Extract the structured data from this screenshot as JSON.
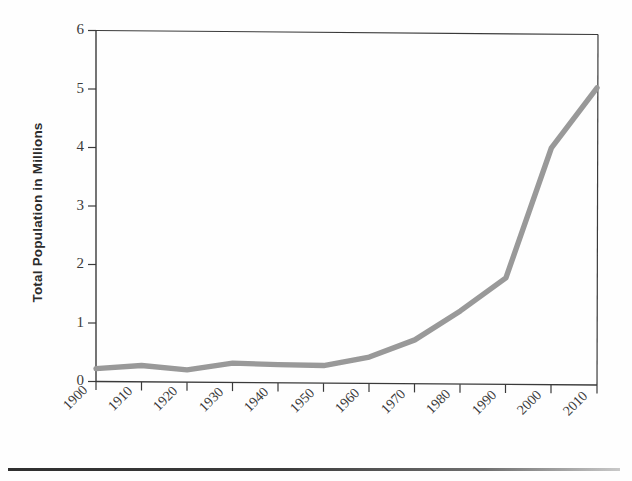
{
  "chart_data": {
    "type": "line",
    "title": "",
    "xlabel": "",
    "ylabel": "Total Population in Millions",
    "x": [
      1900,
      1910,
      1920,
      1930,
      1940,
      1950,
      1960,
      1970,
      1980,
      1990,
      2000,
      2010
    ],
    "categories": [
      "1900",
      "1910",
      "1920",
      "1930",
      "1940",
      "1950",
      "1960",
      "1970",
      "1980",
      "1990",
      "2000",
      "2010"
    ],
    "values": [
      0.22,
      0.28,
      0.21,
      0.33,
      0.31,
      0.3,
      0.45,
      0.75,
      1.25,
      1.82,
      4.05,
      5.08
    ],
    "series": [
      {
        "name": "Total Population",
        "values": [
          0.22,
          0.28,
          0.21,
          0.33,
          0.31,
          0.3,
          0.45,
          0.75,
          1.25,
          1.82,
          4.05,
          5.08
        ],
        "color": "#999999"
      }
    ],
    "xlim": [
      1900,
      2010
    ],
    "ylim": [
      0,
      6
    ],
    "yticks": [
      0,
      1,
      2,
      3,
      4,
      5,
      6
    ],
    "ytick_labels": [
      "0",
      "1",
      "2",
      "3",
      "4",
      "5",
      "6"
    ],
    "xticks": [
      1900,
      1910,
      1920,
      1930,
      1940,
      1950,
      1960,
      1970,
      1980,
      1990,
      2000,
      2010
    ],
    "xtick_labels": [
      "1900",
      "1910",
      "1920",
      "1930",
      "1940",
      "1950",
      "1960",
      "1970",
      "1980",
      "1990",
      "2000",
      "2010"
    ],
    "grid": false,
    "legend": false,
    "legend_position": "none",
    "line_color": "#999999",
    "axis_color": "#333333",
    "background_color": "#fefefe",
    "xtick_label_rotation": -45
  },
  "figure": {
    "bottom_rule_color": "#2f2f2f"
  }
}
